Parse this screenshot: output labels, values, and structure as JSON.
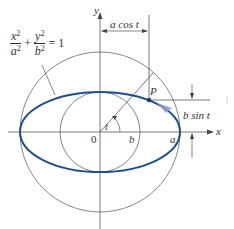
{
  "diagram": {
    "equation": {
      "left_num": "x",
      "left_den": "a",
      "right_num": "y",
      "right_den": "b",
      "exponent": "2",
      "plus": "+",
      "equals": "= 1"
    },
    "labels": {
      "y_axis": "y",
      "x_axis": "x",
      "origin": "0",
      "point": "P",
      "angle": "t",
      "a_cos_t": "a cos t",
      "b_sin_t": "b sin t",
      "b": "b",
      "a": "a"
    },
    "geometry": {
      "origin_px": [
        100,
        132
      ],
      "a_radius_px": 80,
      "b_radius_px": 40,
      "t_degrees": 48
    },
    "colors": {
      "ellipse": "#1f4f8a",
      "lines": "#555555",
      "arrow_highlight": "#8a9cc9"
    }
  }
}
